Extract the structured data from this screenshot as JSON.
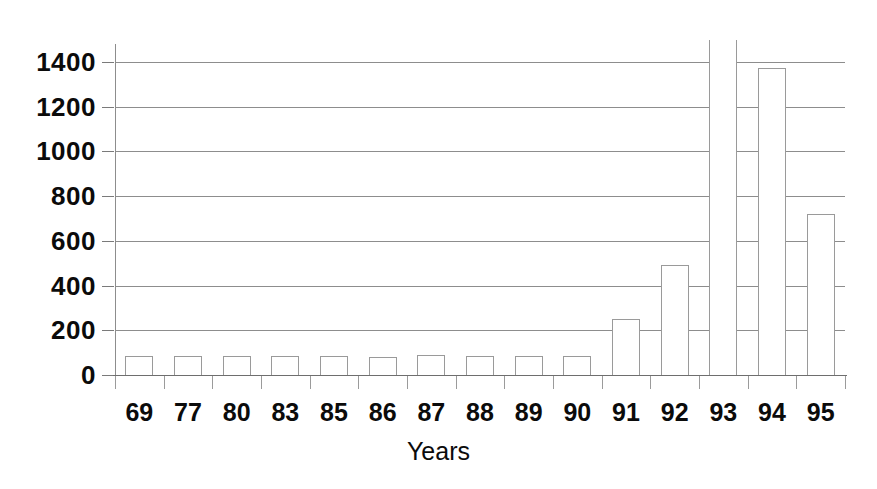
{
  "chart_data": {
    "type": "bar",
    "title": "",
    "subtitle": "",
    "xlabel": "Years",
    "ylabel": "",
    "categories": [
      "69",
      "77",
      "80",
      "83",
      "85",
      "86",
      "87",
      "88",
      "89",
      "90",
      "91",
      "92",
      "93",
      "94",
      "95"
    ],
    "values": [
      85,
      85,
      85,
      85,
      85,
      82,
      88,
      85,
      85,
      85,
      250,
      490,
      1700,
      1375,
      720
    ],
    "clipped": [
      false,
      false,
      false,
      false,
      false,
      false,
      false,
      false,
      false,
      false,
      false,
      false,
      true,
      false,
      false
    ],
    "ylim": [
      0,
      1400
    ],
    "ytick_labels": [
      "0",
      "200",
      "400",
      "600",
      "800",
      "1000",
      "1200",
      "1400"
    ],
    "yticks": [
      0,
      200,
      400,
      600,
      800,
      1000,
      1200,
      1400
    ],
    "grid": true,
    "legend": "none",
    "bar_style": "outline",
    "colors": {
      "bar_outline": "#9a9a9a",
      "bar_fill": "#ffffff",
      "gridline": "#8d8d8d",
      "axis": "#6e6e6e",
      "text": "#0b0b0b",
      "background": "#ffffff"
    }
  }
}
